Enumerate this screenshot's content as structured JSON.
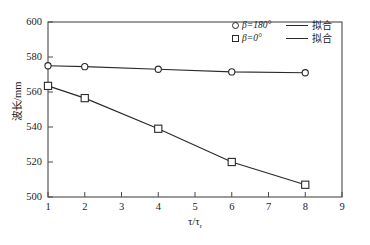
{
  "chart_data": {
    "type": "line",
    "title": "",
    "xlabel": "τ/τ",
    "xlabel_sub": "r",
    "ylabel": "波长/mm",
    "xlim": [
      1,
      9
    ],
    "ylim": [
      500,
      600
    ],
    "xticks": [
      "1",
      "2",
      "3",
      "4",
      "5",
      "6",
      "7",
      "8",
      "9"
    ],
    "yticks": [
      "600",
      "580",
      "560",
      "540",
      "520",
      "500"
    ],
    "grid": false,
    "legend_position": "top-right",
    "x": [
      1,
      2,
      4,
      6,
      8
    ],
    "series": [
      {
        "name": "β=180°",
        "marker": "circle",
        "values": [
          575.0,
          574.5,
          573.0,
          571.5,
          571.0
        ],
        "fit_label": "拟合"
      },
      {
        "name": "β=0°",
        "marker": "square",
        "values": [
          563.5,
          556.5,
          539.0,
          520.0,
          507.0
        ],
        "fit_label": "拟合"
      }
    ]
  },
  "legend": {
    "rows": [
      {
        "series_label": "β=180°",
        "marker": "circle-marker",
        "fit_label": "拟合"
      },
      {
        "series_label": "β=0°",
        "marker": "square-marker",
        "fit_label": "拟合"
      }
    ]
  },
  "axes": {
    "y_tick_labels": [
      "600",
      "580",
      "560",
      "540",
      "520",
      "500"
    ],
    "x_tick_labels": [
      "1",
      "2",
      "3",
      "4",
      "5",
      "6",
      "7",
      "8",
      "9"
    ],
    "y_axis_title": "波长/mm",
    "x_axis_title_main": "τ/τ",
    "x_axis_title_sub": "r"
  },
  "colors": {
    "axis": "#3a3a3a",
    "series_line": "#2a2a2a",
    "marker_stroke": "#2a2a2a",
    "background": "#ffffff"
  }
}
